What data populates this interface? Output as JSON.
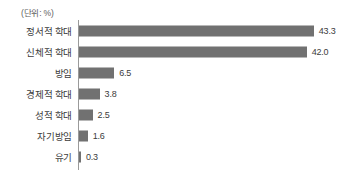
{
  "unit_note": "(단위: %)",
  "chart_data": {
    "type": "bar",
    "orientation": "horizontal",
    "title": "",
    "subtitle": "",
    "xlabel": "",
    "ylabel": "",
    "unit": "%",
    "unit_note": "(단위: %)",
    "grid": false,
    "legend": false,
    "legend_position": "none",
    "xlim": [
      0,
      45
    ],
    "axis_line": "vertical-left",
    "bar_color": "#717171",
    "axis_color": "#9a9a9a",
    "text_color": "#3c3c3c",
    "background": "#ffffff",
    "categories": [
      "정서적 학대",
      "신체적 학대",
      "방임",
      "경제적 학대",
      "성적 학대",
      "자기방임",
      "유기"
    ],
    "values": [
      43.3,
      42.0,
      6.5,
      3.8,
      2.5,
      1.6,
      0.3
    ],
    "value_labels": [
      "43.3",
      "42.0",
      "6.5",
      "3.8",
      "2.5",
      "1.6",
      "0.3"
    ]
  }
}
